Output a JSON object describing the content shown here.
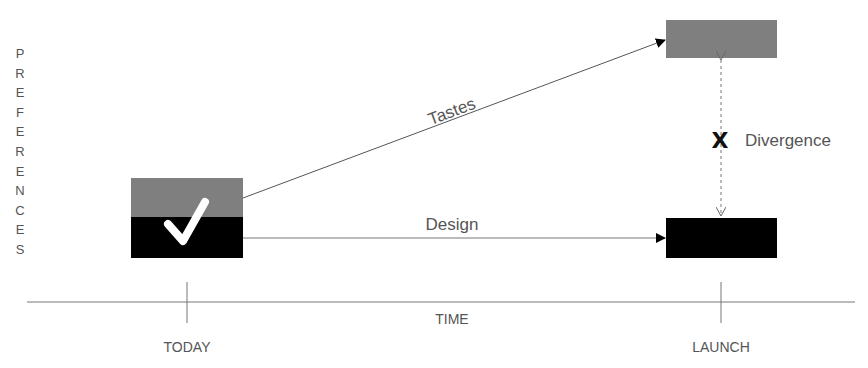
{
  "y_axis": {
    "label": "PREFERENCES",
    "letters": [
      "P",
      "R",
      "E",
      "F",
      "E",
      "R",
      "E",
      "N",
      "C",
      "E",
      "S"
    ]
  },
  "x_axis": {
    "label": "TIME",
    "ticks": [
      {
        "label": "TODAY"
      },
      {
        "label": "LAUNCH"
      }
    ]
  },
  "arrows": {
    "tastes_label": "Tastes",
    "design_label": "Design"
  },
  "divergence": {
    "marker": "X",
    "label": "Divergence"
  },
  "today_box": {
    "check_glyph": "✓",
    "top_color": "#7f7f7f",
    "bottom_color": "#000000"
  },
  "launch_boxes": {
    "tastes_color": "#7f7f7f",
    "design_color": "#000000"
  }
}
